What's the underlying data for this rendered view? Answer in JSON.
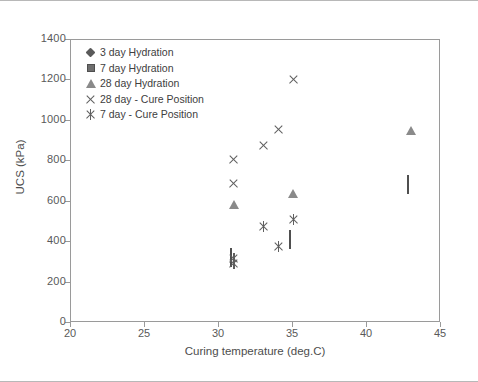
{
  "chart_data": {
    "type": "scatter",
    "title": "",
    "xlabel": "Curing temperature (deg.C)",
    "ylabel": "UCS (kPa)",
    "xlim": [
      20,
      45
    ],
    "ylim": [
      0,
      1400
    ],
    "xticks": [
      20,
      25,
      30,
      35,
      40,
      45
    ],
    "yticks": [
      0,
      200,
      400,
      600,
      800,
      1000,
      1200,
      1400
    ],
    "grid": false,
    "legend_position": "top-left",
    "series": [
      {
        "name": "3 day Hydration",
        "marker": "diamond",
        "color": "#5a5a5a",
        "points": [
          {
            "x": 31,
            "y": 140
          },
          {
            "x": 35,
            "y": 198
          },
          {
            "x": 43,
            "y": 400
          }
        ]
      },
      {
        "name": "7 day Hydration",
        "marker": "square",
        "color": "#6e6e6e",
        "points": [
          {
            "x": 31,
            "y": 345
          },
          {
            "x": 35,
            "y": 437
          },
          {
            "x": 43,
            "y": 707
          }
        ]
      },
      {
        "name": "28 day Hydration",
        "marker": "triangle",
        "color": "#8a8a8a",
        "points": [
          {
            "x": 31,
            "y": 672
          },
          {
            "x": 35,
            "y": 727
          },
          {
            "x": 43,
            "y": 1035
          }
        ]
      },
      {
        "name": "28 day - Cure Position",
        "marker": "cross",
        "color": "#5f5f5f",
        "points": [
          {
            "x": 31,
            "y": 807
          },
          {
            "x": 31,
            "y": 692
          },
          {
            "x": 33,
            "y": 880
          },
          {
            "x": 34,
            "y": 958
          },
          {
            "x": 35,
            "y": 1205
          }
        ]
      },
      {
        "name": "7 day - Cure Position",
        "marker": "asterisk",
        "color": "#5f5f5f",
        "points": [
          {
            "x": 31,
            "y": 292
          },
          {
            "x": 31,
            "y": 320
          },
          {
            "x": 33,
            "y": 477
          },
          {
            "x": 34,
            "y": 378
          },
          {
            "x": 35,
            "y": 512
          }
        ]
      }
    ]
  },
  "axis": {
    "y_tick_labels": [
      "1400",
      "1200",
      "1000",
      "800",
      "600",
      "400",
      "200",
      "0"
    ],
    "x_tick_labels": [
      "20",
      "25",
      "30",
      "35",
      "40",
      "45"
    ],
    "x_title": "Curing temperature (deg.C)",
    "y_title": "UCS (kPa)"
  }
}
